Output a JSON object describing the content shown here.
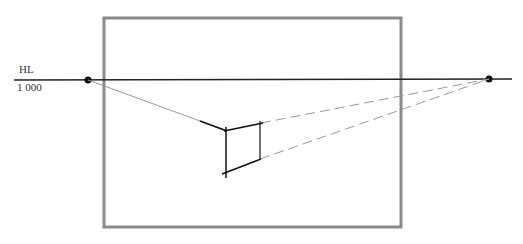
{
  "horizon_label": "HL",
  "horizon_value": "1 000",
  "colors": {
    "frame": "#8a8a8a",
    "horizon": "#222222",
    "construction": "#9a9a9a",
    "box": "#111111"
  }
}
